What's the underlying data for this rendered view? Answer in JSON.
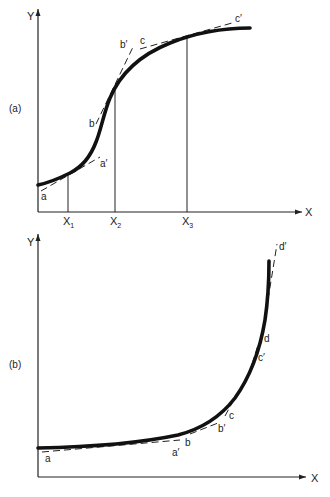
{
  "panel_a": {
    "label": "(a)",
    "y_axis_label": "Y",
    "x_axis_label": "X",
    "x_ticks": [
      {
        "main": "X",
        "sub": "1"
      },
      {
        "main": "X",
        "sub": "2"
      },
      {
        "main": "X",
        "sub": "3"
      }
    ],
    "tangent_labels": {
      "a": "a",
      "a_prime": "a′",
      "b": "b",
      "b_prime": "b′",
      "c": "c",
      "c_prime": "c′"
    },
    "curve_shape": "sigmoid (S-shaped)"
  },
  "panel_b": {
    "label": "(b)",
    "y_axis_label": "Y",
    "x_axis_label": "X",
    "tangent_labels": {
      "a": "a",
      "a_prime": "a′",
      "b": "b",
      "b_prime": "b′",
      "c": "c",
      "c_prime": "c′",
      "d": "d",
      "d_prime": "d′"
    },
    "curve_shape": "exponential (J-shaped)"
  }
}
